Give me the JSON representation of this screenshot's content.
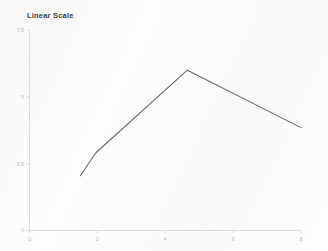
{
  "chart_data": {
    "type": "line",
    "title": "Linear Scale",
    "xlabel": "",
    "ylabel": "",
    "xlim": [
      0,
      8
    ],
    "ylim": [
      0,
      7.5
    ],
    "grid": false,
    "legend": false,
    "x_ticks": [
      "0",
      "2",
      "4",
      "6",
      "8"
    ],
    "x_tick_values": [
      0,
      2,
      4,
      6,
      8
    ],
    "y_ticks": [
      "0",
      "2.5",
      "5",
      "7.5"
    ],
    "y_tick_values": [
      0,
      2.5,
      5,
      7.5
    ],
    "series": [
      {
        "name": "series-1",
        "color": "#63636d",
        "x": [
          1.5,
          1.95,
          4.65,
          8.0
        ],
        "y": [
          2.05,
          2.9,
          6.0,
          3.85
        ]
      }
    ]
  },
  "axes": {
    "y_axis_name": "y-axis",
    "x_axis_name": "x-axis"
  }
}
